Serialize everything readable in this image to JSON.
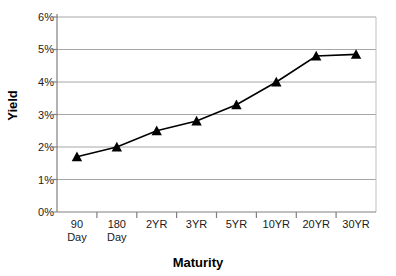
{
  "chart_data": {
    "type": "line",
    "title": "",
    "xlabel": "Maturity",
    "ylabel": "Yield",
    "categories": [
      "90 Day",
      "180 Day",
      "2YR",
      "3YR",
      "5YR",
      "10YR",
      "20YR",
      "30YR"
    ],
    "category_lines": [
      [
        "90",
        "Day"
      ],
      [
        "180",
        "Day"
      ],
      [
        "2YR"
      ],
      [
        "3YR"
      ],
      [
        "5YR"
      ],
      [
        "10YR"
      ],
      [
        "20YR"
      ],
      [
        "30YR"
      ]
    ],
    "values": [
      1.7,
      2.0,
      2.5,
      2.8,
      3.3,
      4.0,
      4.8,
      4.85
    ],
    "value_labels": [
      "1.7%",
      "2.0%",
      "2.5%",
      "2.8%",
      "3.3%",
      "4.0%",
      "4.8%",
      "4.85%"
    ],
    "ylim": [
      0,
      6
    ],
    "ytick_values": [
      0,
      1,
      2,
      3,
      4,
      5,
      6
    ],
    "ytick_labels": [
      "0%",
      "1%",
      "2%",
      "3%",
      "4%",
      "5%",
      "6%"
    ],
    "grid": true,
    "legend": "none",
    "marker": "triangle",
    "colors": {
      "line": "#000000",
      "marker": "#000000",
      "grid": "#a6a6a6",
      "axis": "#808080",
      "plot_border": "#bfbfbf",
      "background": "#ffffff",
      "text": "#1a1a1a"
    }
  }
}
